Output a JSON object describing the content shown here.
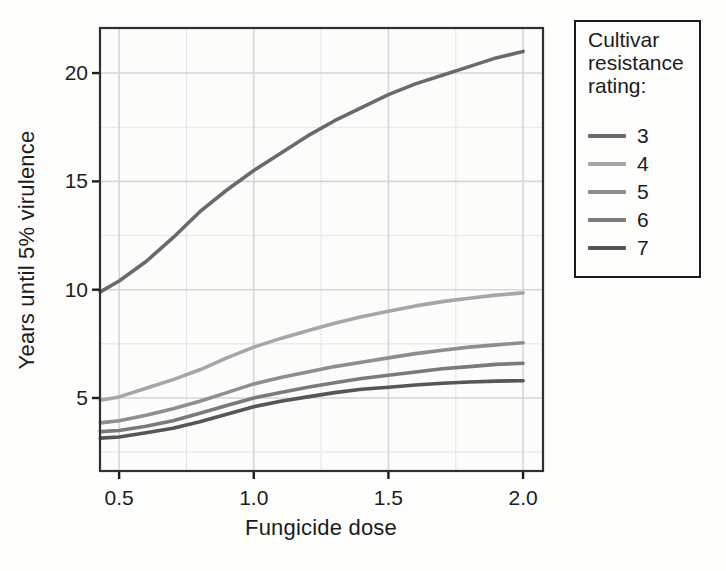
{
  "style": {
    "background": "#fdfdfc",
    "panel_fill": "#fcfcfb",
    "grid_major_color": "#d6d6d6",
    "grid_minor_color": "#e6e6e6",
    "panel_border_color": "#303030",
    "tick_color": "#1c1c1c",
    "text_color": "#1c1c1c"
  },
  "legend": {
    "title_lines": [
      "Cultivar",
      "resistance",
      "rating:"
    ]
  },
  "chart_data": {
    "type": "line",
    "title": "",
    "xlabel": "Fungicide dose",
    "ylabel": "Years until 5% virulence",
    "legend_title": "Cultivar resistance rating:",
    "legend_position": "outside-top-right",
    "grid": "major+minor",
    "xlim": [
      0.429,
      2.074
    ],
    "ylim": [
      1.63,
      22.08
    ],
    "x_ticks": [
      0.5,
      1.0,
      1.5,
      2.0
    ],
    "x_tick_labels": [
      "0.5",
      "1.0",
      "1.5",
      "2.0"
    ],
    "y_ticks": [
      5,
      10,
      15,
      20
    ],
    "y_tick_labels": [
      "5",
      "10",
      "15",
      "20"
    ],
    "x_minor_gridlines": [
      0.75,
      1.25,
      1.75
    ],
    "y_minor_gridlines": [
      2.5,
      7.5,
      12.5,
      17.5
    ],
    "x": [
      0.43,
      0.5,
      0.6,
      0.7,
      0.8,
      0.9,
      1.0,
      1.1,
      1.2,
      1.3,
      1.4,
      1.5,
      1.6,
      1.7,
      1.8,
      1.9,
      2.0
    ],
    "series": [
      {
        "name": "3",
        "color": "#6a6a6a",
        "values": [
          9.9,
          10.4,
          11.3,
          12.4,
          13.6,
          14.6,
          15.5,
          16.3,
          17.1,
          17.8,
          18.4,
          19.0,
          19.5,
          19.9,
          20.3,
          20.7,
          21.0
        ]
      },
      {
        "name": "4",
        "color": "#a6a6a6",
        "values": [
          4.9,
          5.05,
          5.45,
          5.85,
          6.3,
          6.85,
          7.35,
          7.75,
          8.1,
          8.45,
          8.75,
          9.0,
          9.25,
          9.45,
          9.6,
          9.75,
          9.85
        ]
      },
      {
        "name": "5",
        "color": "#8e8e8e",
        "values": [
          3.85,
          3.95,
          4.2,
          4.5,
          4.85,
          5.25,
          5.65,
          5.95,
          6.2,
          6.45,
          6.65,
          6.85,
          7.05,
          7.2,
          7.35,
          7.45,
          7.55
        ]
      },
      {
        "name": "6",
        "color": "#7a7a7a",
        "values": [
          3.45,
          3.5,
          3.7,
          3.95,
          4.3,
          4.65,
          5.0,
          5.25,
          5.5,
          5.7,
          5.9,
          6.05,
          6.2,
          6.35,
          6.45,
          6.55,
          6.6
        ]
      },
      {
        "name": "7",
        "color": "#565656",
        "values": [
          3.15,
          3.2,
          3.4,
          3.6,
          3.9,
          4.25,
          4.6,
          4.85,
          5.05,
          5.25,
          5.4,
          5.5,
          5.6,
          5.68,
          5.74,
          5.78,
          5.8
        ]
      }
    ]
  }
}
